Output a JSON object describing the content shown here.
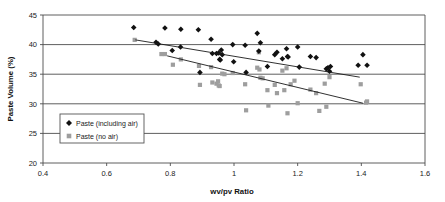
{
  "chart_data": {
    "type": "scatter",
    "title": "",
    "xlabel": "wv/pv Ratio",
    "ylabel": "Paste Volume (%)",
    "xlim": [
      0.4,
      1.6
    ],
    "ylim": [
      20,
      45
    ],
    "xticks": [
      "0.4",
      "0.6",
      "0.8",
      "1",
      "1.2",
      "1.4",
      "1.6"
    ],
    "xtick_values": [
      0.4,
      0.6,
      0.8,
      1.0,
      1.2,
      1.4,
      1.6
    ],
    "yticks": [
      "20",
      "25",
      "30",
      "35",
      "40",
      "45"
    ],
    "ytick_values": [
      20,
      25,
      30,
      35,
      40,
      45
    ],
    "grid": "horizontal",
    "legend_position": "inside-lower-left",
    "series": [
      {
        "name": "Paste (including air)",
        "marker": "diamond",
        "color": "#111111",
        "points": [
          [
            0.685,
            42.9
          ],
          [
            0.755,
            40.4
          ],
          [
            0.762,
            40.1
          ],
          [
            0.783,
            42.8
          ],
          [
            0.806,
            39.0
          ],
          [
            0.832,
            39.6
          ],
          [
            0.833,
            42.6
          ],
          [
            0.888,
            42.5
          ],
          [
            0.893,
            35.3
          ],
          [
            0.928,
            40.9
          ],
          [
            0.932,
            38.5
          ],
          [
            0.945,
            38.5
          ],
          [
            0.952,
            38.6
          ],
          [
            0.955,
            37.5
          ],
          [
            0.957,
            37.4
          ],
          [
            0.96,
            39.1
          ],
          [
            0.963,
            38.3
          ],
          [
            0.996,
            40.0
          ],
          [
            0.999,
            37.1
          ],
          [
            1.035,
            39.9
          ],
          [
            1.038,
            35.3
          ],
          [
            1.073,
            41.9
          ],
          [
            1.078,
            38.9
          ],
          [
            1.083,
            40.3
          ],
          [
            1.105,
            36.3
          ],
          [
            1.128,
            38.3
          ],
          [
            1.135,
            38.7
          ],
          [
            1.152,
            37.6
          ],
          [
            1.165,
            39.3
          ],
          [
            1.168,
            38.0
          ],
          [
            1.17,
            37.9
          ],
          [
            1.2,
            39.6
          ],
          [
            1.205,
            36.2
          ],
          [
            1.24,
            38.0
          ],
          [
            1.258,
            37.8
          ],
          [
            1.29,
            35.9
          ],
          [
            1.295,
            36.1
          ],
          [
            1.3,
            35.5
          ],
          [
            1.303,
            36.3
          ],
          [
            1.39,
            36.5
          ],
          [
            1.405,
            38.3
          ],
          [
            1.418,
            36.5
          ]
        ]
      },
      {
        "name": "Paste (no air)",
        "marker": "square",
        "color": "#9e9e9e",
        "points": [
          [
            0.688,
            40.8
          ],
          [
            0.772,
            38.4
          ],
          [
            0.783,
            38.4
          ],
          [
            0.808,
            36.6
          ],
          [
            0.833,
            37.5
          ],
          [
            0.89,
            36.4
          ],
          [
            0.893,
            33.2
          ],
          [
            0.928,
            36.2
          ],
          [
            0.932,
            33.6
          ],
          [
            0.945,
            33.4
          ],
          [
            0.95,
            33.8
          ],
          [
            0.952,
            33.1
          ],
          [
            0.955,
            33.0
          ],
          [
            0.963,
            35.1
          ],
          [
            0.97,
            35.0
          ],
          [
            0.996,
            35.2
          ],
          [
            1.035,
            33.3
          ],
          [
            1.038,
            28.9
          ],
          [
            1.073,
            36.1
          ],
          [
            1.078,
            38.7
          ],
          [
            1.08,
            35.8
          ],
          [
            1.083,
            34.4
          ],
          [
            1.09,
            34.3
          ],
          [
            1.105,
            32.3
          ],
          [
            1.108,
            29.7
          ],
          [
            1.128,
            33.2
          ],
          [
            1.135,
            31.8
          ],
          [
            1.152,
            35.6
          ],
          [
            1.158,
            32.3
          ],
          [
            1.165,
            36.0
          ],
          [
            1.168,
            28.4
          ],
          [
            1.178,
            33.3
          ],
          [
            1.19,
            33.9
          ],
          [
            1.2,
            30.1
          ],
          [
            1.24,
            32.4
          ],
          [
            1.258,
            31.8
          ],
          [
            1.268,
            28.8
          ],
          [
            1.285,
            33.4
          ],
          [
            1.29,
            29.5
          ],
          [
            1.3,
            34.5
          ],
          [
            1.398,
            33.3
          ],
          [
            1.415,
            30.2
          ],
          [
            1.418,
            30.4
          ]
        ]
      }
    ],
    "trendlines": [
      {
        "name": "trend-including-air",
        "x": [
          0.69,
          1.395
        ],
        "y": [
          40.8,
          34.5
        ]
      },
      {
        "name": "trend-no-air",
        "x": [
          0.79,
          1.405
        ],
        "y": [
          38.1,
          30.1
        ]
      }
    ]
  },
  "legend": {
    "items": [
      {
        "label": "Paste (including air)",
        "marker": "diamond",
        "color": "#111111"
      },
      {
        "label": "Paste (no air)",
        "marker": "square",
        "color": "#9e9e9e"
      }
    ]
  }
}
